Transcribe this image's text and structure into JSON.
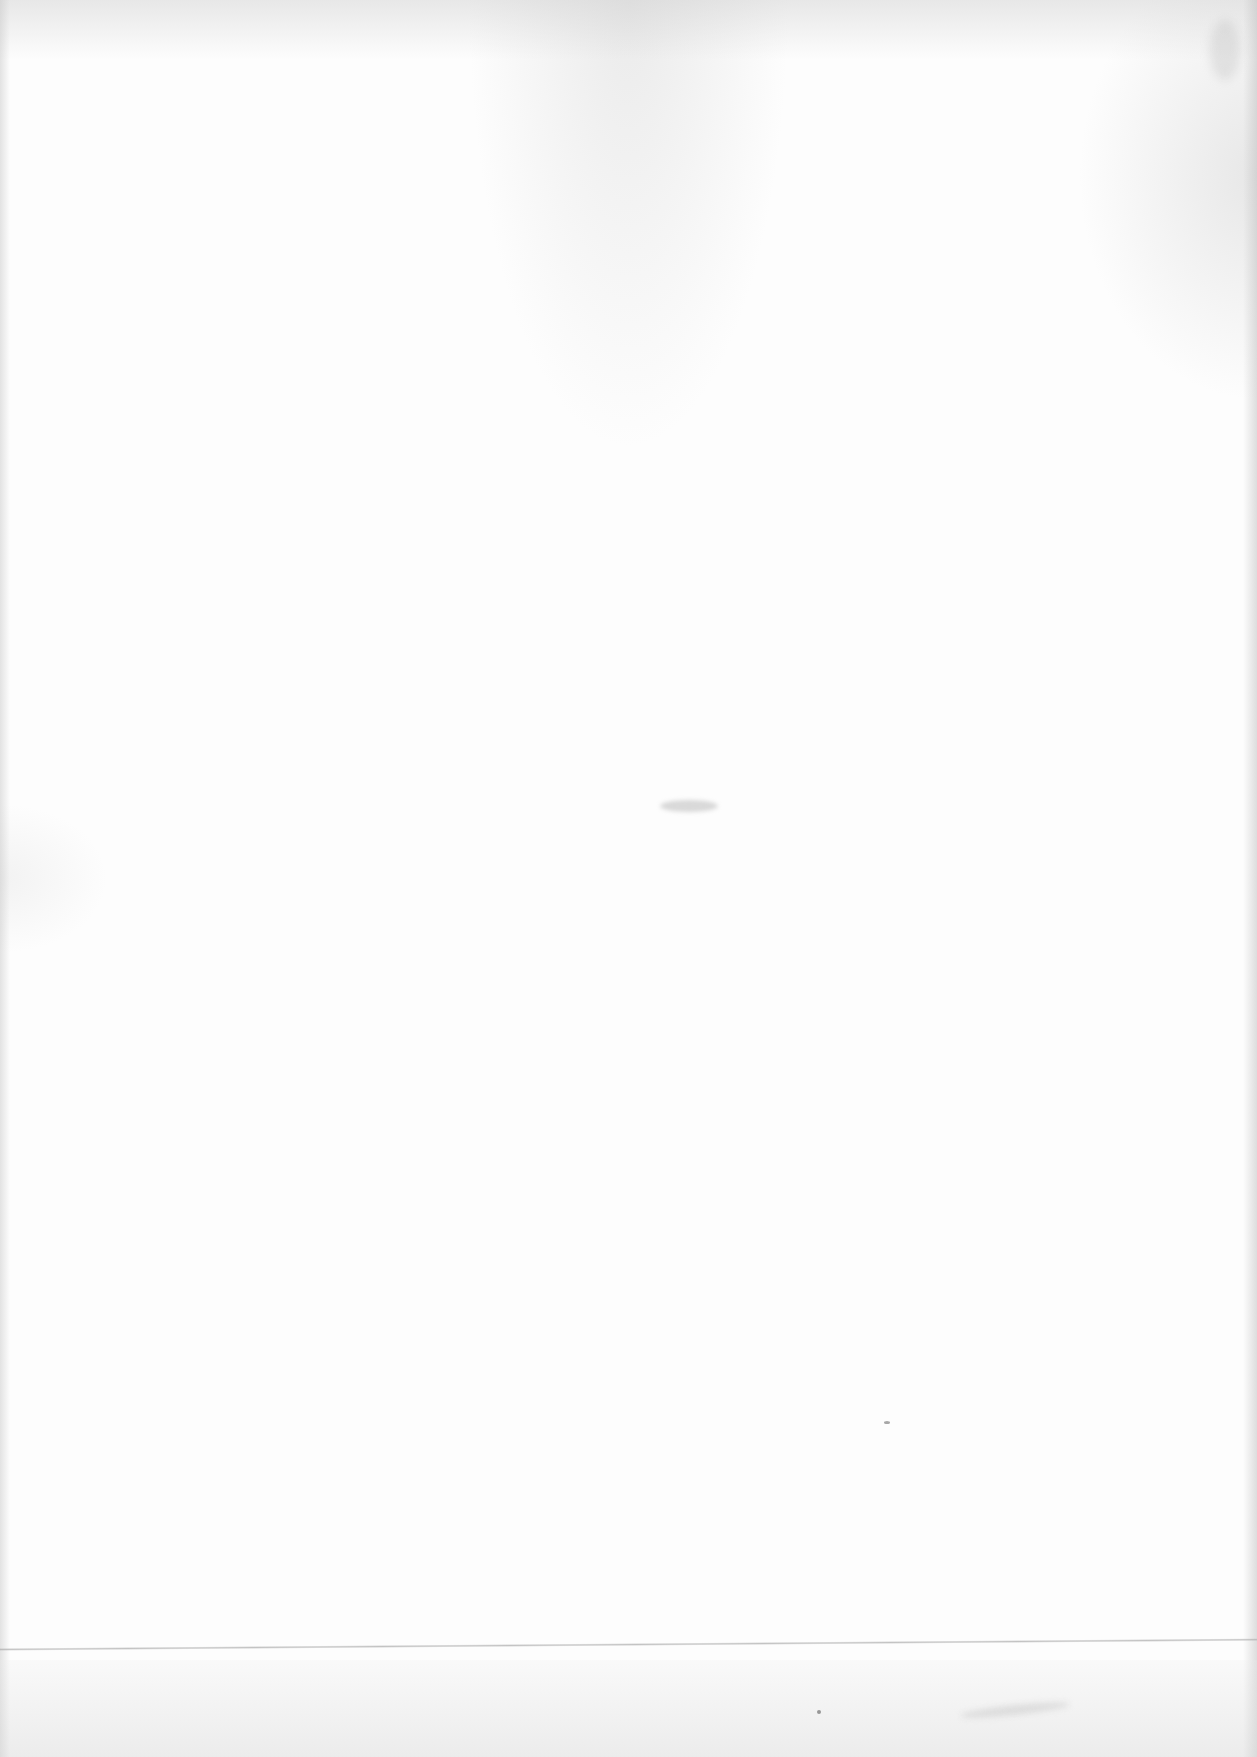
{
  "page": {
    "type": "blank-scanned-page",
    "text_content": "",
    "background_color": "#fdfdfd",
    "artifacts": [
      {
        "kind": "horizontal-line",
        "description": "faint gray fold/scan line near bottom",
        "color": "#afafaf"
      },
      {
        "kind": "smudge",
        "description": "small gray smudge near page center"
      },
      {
        "kind": "specks",
        "description": "scattered paper texture specks"
      }
    ]
  }
}
